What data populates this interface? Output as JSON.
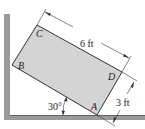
{
  "diagram": {
    "type": "statics-rectangle-on-wall",
    "points": {
      "A": "A",
      "B": "B",
      "C": "C",
      "D": "D"
    },
    "dimensions": {
      "length_label": "6 ft",
      "width_label": "3 ft",
      "angle_label": "30°"
    },
    "colors": {
      "block_fill": "#d4d4d4",
      "surface_fill": "#9a9a9a",
      "line": "#333333"
    }
  }
}
